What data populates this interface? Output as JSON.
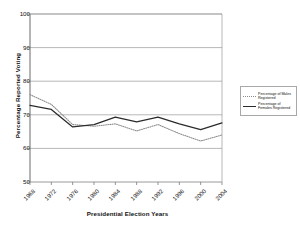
{
  "chart_data": {
    "type": "line",
    "title": "",
    "xlabel": "Presidential Election Years",
    "ylabel": "Percentage Reported Voting",
    "categories": [
      "1968",
      "1972",
      "1976",
      "1980",
      "1984",
      "1988",
      "1992",
      "1996",
      "2000",
      "2004"
    ],
    "ylim": [
      50,
      100
    ],
    "yticks": [
      50,
      60,
      70,
      80,
      90,
      100
    ],
    "grid": true,
    "legend_position": "right",
    "series": [
      {
        "name": "Percentage of Males Registered",
        "style": "dotted",
        "color": "#8a8a8a",
        "values": [
          76.0,
          73.1,
          67.1,
          66.6,
          67.3,
          65.2,
          67.1,
          64.4,
          62.2,
          64.0
        ]
      },
      {
        "name": "Percentage of Females Registered",
        "style": "solid",
        "color": "#2b2b2b",
        "values": [
          72.8,
          71.6,
          66.4,
          67.1,
          69.3,
          67.9,
          69.3,
          67.3,
          65.6,
          67.6
        ]
      }
    ]
  },
  "legend": {
    "entries": [
      {
        "label": "Percentage of Males Registered"
      },
      {
        "label": "Percentage of Females Registered"
      }
    ]
  }
}
